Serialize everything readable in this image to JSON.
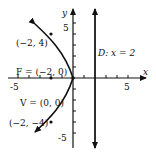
{
  "diagram": {
    "type": "parabola",
    "equation_hint": "y^2 = -8x",
    "axes": {
      "x_label": "x",
      "y_label": "y",
      "x_ticks": [
        "-5",
        "5"
      ],
      "y_ticks": [
        "5",
        "-5"
      ]
    },
    "labels": {
      "point_top": "(−2, 4)",
      "focus": "F = (−2, 0)",
      "vertex": "V = (0, 0)",
      "point_bottom": "(−2, −4)",
      "directrix": "D: x = 2"
    },
    "colors": {
      "ink": "#111111",
      "background": "#ffffff"
    }
  }
}
